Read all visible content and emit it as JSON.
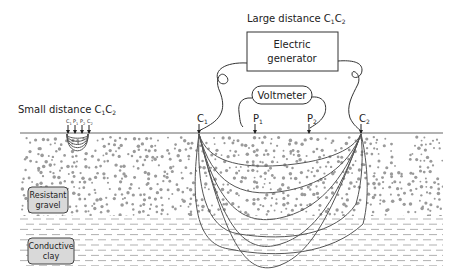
{
  "diagram": {
    "title_large": "Large distance C",
    "title_large_sub1": "1",
    "title_large_mid": "C",
    "title_large_sub2": "2",
    "title_small": "Small distance C",
    "title_small_sub1": "1",
    "title_small_mid": "C",
    "title_small_sub2": "2",
    "generator_line1": "Electric",
    "generator_line2": "generator",
    "voltmeter": "Voltmeter",
    "electrodes": [
      {
        "letter": "C",
        "sub": "1"
      },
      {
        "letter": "P",
        "sub": "1"
      },
      {
        "letter": "P",
        "sub": "2"
      },
      {
        "letter": "C",
        "sub": "2"
      }
    ],
    "small_electrodes": [
      {
        "letter": "C",
        "sub": "1"
      },
      {
        "letter": "P",
        "sub": "1"
      },
      {
        "letter": "P",
        "sub": "2"
      },
      {
        "letter": "C",
        "sub": "2"
      }
    ],
    "layers": [
      {
        "name": "resistant-gravel",
        "line1": "Resistant",
        "line2": "gravel"
      },
      {
        "name": "conductive-clay",
        "line1": "Conductive",
        "line2": "clay"
      }
    ],
    "colors": {
      "gravel_dot": "#9a9a9a",
      "clay_dash": "#a8a8a8",
      "label_box": "#d9d9d9",
      "line": "#333333"
    }
  }
}
